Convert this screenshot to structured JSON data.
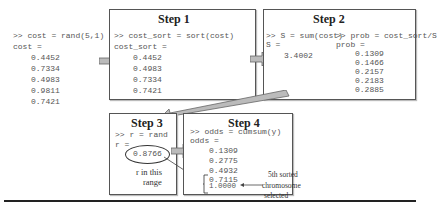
{
  "init": {
    "command": ">> cost = rand(5,1)",
    "output_label": "cost =",
    "values": [
      "0.4452",
      "0.7334",
      "0.4983",
      "0.9811",
      "0.7421"
    ]
  },
  "step1": {
    "title": "Step 1",
    "command": ">> cost_sort = sort(cost)",
    "output_label": "cost_sort =",
    "values": [
      "0.4452",
      "0.4983",
      "0.7334",
      "0.7421",
      "0.9811"
    ]
  },
  "step2": {
    "title": "Step 2",
    "command_left": ">> S = sum(cost)",
    "output_left_label": "S =",
    "sum_value": "3.4002",
    "command_right": ">> prob = cost_sort/S",
    "output_right_label": "prob =",
    "values": [
      "0.1309",
      "0.1466",
      "0.2157",
      "0.2183",
      "0.2885"
    ]
  },
  "step3": {
    "title": "Step 3",
    "command": ">> r = rand",
    "output_label": "r =",
    "rand_value": "0.8766",
    "note_line1": "r in this",
    "note_line2": "range"
  },
  "step4": {
    "title": "Step 4",
    "command": ">> odds = cumsum(y)",
    "output_label": "odds =",
    "values": [
      "0.1309",
      "0.2775",
      "0.4932",
      "0.7115",
      "1.0000"
    ],
    "annotation_line1": "5th sorted",
    "annotation_line2": "chromosome",
    "annotation_line3": "selected"
  }
}
